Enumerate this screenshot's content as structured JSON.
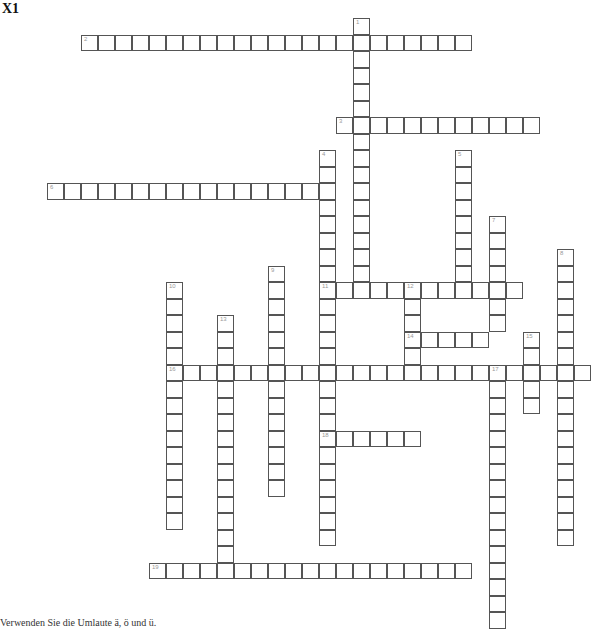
{
  "title": "X1",
  "note": "Verwenden Sie die Umlaute ä, ö und ü.",
  "grid": {
    "origin_x": 47,
    "origin_y": 18.3,
    "cell_w": 17,
    "cell_h": 16.5
  },
  "words": [
    {
      "number": 1,
      "direction": "down",
      "col": 18,
      "row": 0,
      "length": 17
    },
    {
      "number": 2,
      "direction": "across",
      "col": 2,
      "row": 1,
      "length": 23
    },
    {
      "number": 3,
      "direction": "across",
      "col": 17,
      "row": 6,
      "length": 12
    },
    {
      "number": 4,
      "direction": "down",
      "col": 16,
      "row": 8,
      "length": 24
    },
    {
      "number": 5,
      "direction": "down",
      "col": 24,
      "row": 8,
      "length": 9
    },
    {
      "number": 6,
      "direction": "across",
      "col": 0,
      "row": 10,
      "length": 17
    },
    {
      "number": 7,
      "direction": "down",
      "col": 26,
      "row": 12,
      "length": 7
    },
    {
      "number": 8,
      "direction": "down",
      "col": 30,
      "row": 14,
      "length": 18
    },
    {
      "number": 9,
      "direction": "down",
      "col": 13,
      "row": 15,
      "length": 14
    },
    {
      "number": 10,
      "direction": "down",
      "col": 7,
      "row": 16,
      "length": 15
    },
    {
      "number": 11,
      "direction": "across",
      "col": 16,
      "row": 16,
      "length": 12
    },
    {
      "number": 12,
      "direction": "down",
      "col": 21,
      "row": 16,
      "length": 6
    },
    {
      "number": 13,
      "direction": "down",
      "col": 10,
      "row": 18,
      "length": 16
    },
    {
      "number": 14,
      "direction": "across",
      "col": 21,
      "row": 19,
      "length": 5
    },
    {
      "number": 15,
      "direction": "down",
      "col": 28,
      "row": 19,
      "length": 5
    },
    {
      "number": 16,
      "direction": "across",
      "col": 7,
      "row": 21,
      "length": 25
    },
    {
      "number": 17,
      "direction": "down",
      "col": 26,
      "row": 21,
      "length": 16
    },
    {
      "number": 18,
      "direction": "across",
      "col": 16,
      "row": 25,
      "length": 6
    },
    {
      "number": 19,
      "direction": "across",
      "col": 6,
      "row": 33,
      "length": 19
    }
  ]
}
